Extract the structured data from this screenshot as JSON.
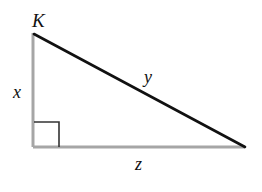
{
  "diagram": {
    "type": "right-triangle",
    "vertices": {
      "top": {
        "label": "K",
        "x": 33,
        "y": 33
      },
      "right_angle": {
        "label": "",
        "x": 33,
        "y": 147
      },
      "far": {
        "label": "",
        "x": 245,
        "y": 147
      }
    },
    "sides": {
      "vertical_leg": {
        "label": "x",
        "color": "#a6a6a6"
      },
      "hypotenuse": {
        "label": "y",
        "color": "#111111"
      },
      "horizontal_leg": {
        "label": "z",
        "color": "#a6a6a6"
      }
    },
    "right_angle_marker": {
      "size": 25,
      "color": "#333333"
    }
  },
  "labels": {
    "vertex_k": "K",
    "side_x": "x",
    "side_y": "y",
    "side_z": "z"
  }
}
